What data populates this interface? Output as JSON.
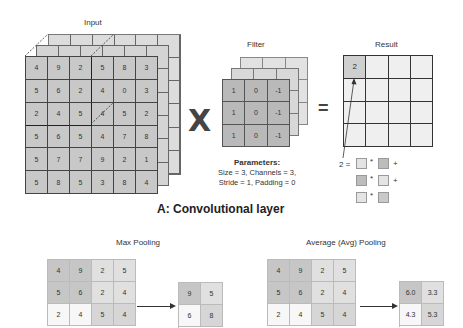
{
  "conv": {
    "input_label": "Input",
    "filter_label": "Filter",
    "result_label": "Result",
    "operator_multiply": "X",
    "operator_equals": "=",
    "input_matrix": [
      [
        4,
        9,
        2,
        5,
        8,
        3
      ],
      [
        5,
        6,
        2,
        4,
        0,
        3
      ],
      [
        2,
        4,
        5,
        4,
        5,
        2
      ],
      [
        5,
        6,
        5,
        4,
        7,
        8
      ],
      [
        5,
        7,
        7,
        9,
        2,
        1
      ],
      [
        5,
        8,
        5,
        3,
        8,
        4
      ]
    ],
    "filter_matrix": [
      [
        1,
        0,
        -1
      ],
      [
        1,
        0,
        -1
      ],
      [
        1,
        0,
        -1
      ]
    ],
    "result_first_value": "2",
    "result_size": 4,
    "params_title": "Parameters:",
    "params_line1": "Size = 3, Channels = 3,",
    "params_line2": "Stride = 1, Padding = 0",
    "equation": {
      "lhs": "2 =",
      "times": "*",
      "plus": "+"
    },
    "title": "A: Convolutional layer"
  },
  "max_pooling": {
    "label": "Max Pooling",
    "input_matrix": [
      [
        4,
        9,
        2,
        5
      ],
      [
        5,
        6,
        2,
        4
      ],
      [
        2,
        4,
        5,
        4
      ]
    ],
    "output_matrix": [
      [
        "9",
        "5"
      ],
      [
        "6",
        "8"
      ]
    ]
  },
  "avg_pooling": {
    "label": "Average (Avg) Pooling",
    "input_matrix": [
      [
        4,
        9,
        2,
        5
      ],
      [
        5,
        6,
        2,
        4
      ],
      [
        2,
        4,
        5,
        4
      ]
    ],
    "output_matrix": [
      [
        "6.0",
        "3.3"
      ],
      [
        "4.3",
        "5.3"
      ]
    ]
  }
}
